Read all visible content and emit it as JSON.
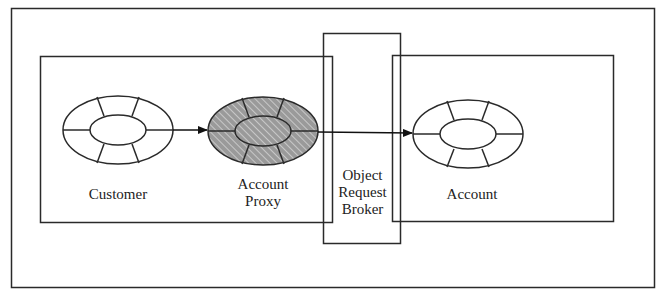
{
  "diagram": {
    "type": "CORBA object proxy architecture",
    "colors": {
      "stroke": "#2a2a2a",
      "proxy_fill": "#9a9a9a",
      "proxy_hatch": "#c8c8c8",
      "background": "#ffffff"
    },
    "nodes": {
      "customer": {
        "label": "Customer"
      },
      "account_proxy": {
        "label_line1": "Account",
        "label_line2": "Proxy"
      },
      "orb": {
        "label_line1": "Object",
        "label_line2": "Request",
        "label_line3": "Broker"
      },
      "account": {
        "label": "Account"
      }
    },
    "edges": [
      {
        "from": "customer",
        "to": "account_proxy",
        "style": "arrow"
      },
      {
        "from": "account_proxy",
        "to": "account",
        "via": "orb",
        "style": "arrow"
      }
    ]
  }
}
